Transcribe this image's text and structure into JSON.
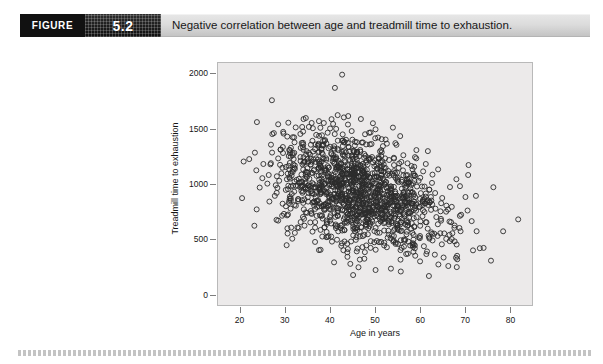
{
  "figure": {
    "label": "FIGURE",
    "number": "5.2",
    "caption": "Negative correlation between age and treadmill time to exhaustion."
  },
  "colors": {
    "header_band": "#dcdcdc",
    "label_box": "#111111",
    "panel_background": "#eceaea",
    "panel_border": "#b9b9b9",
    "point_stroke": "#2b2b2b",
    "rule": "#b9b9b9"
  },
  "chart_data": {
    "type": "scatter",
    "title": "Negative correlation between age and treadmill time to exhaustion.",
    "xlabel": "Age in years",
    "ylabel": "Treadmill time to exhaustion",
    "xlim": [
      15,
      85
    ],
    "ylim": [
      -100,
      2100
    ],
    "xticks": [
      20,
      30,
      40,
      50,
      60,
      70,
      80
    ],
    "xtick_labels": [
      "20",
      "30",
      "40",
      "50",
      "60",
      "70",
      "80"
    ],
    "yticks": [
      0,
      500,
      1000,
      1500,
      2000
    ],
    "ytick_labels": [
      "0",
      "500",
      "1000",
      "1500",
      "2000"
    ],
    "grid": false,
    "legend": false,
    "marker": "open-circle",
    "marker_size_px": 5,
    "n_points": 1400,
    "relationship": "negative",
    "correlation_estimate": -0.45,
    "x_mean": 46,
    "x_sd": 9.5,
    "y_intercept": 1450,
    "y_slope": -11.5,
    "y_residual_sd": 250,
    "x_range_observed": [
      18,
      82
    ],
    "y_range_observed": [
      120,
      2000
    ],
    "density_note": "Dense cluster between ages 38-58 and times 500-1100; sparse tails at young and old ages."
  },
  "axes": {
    "y_label_text": "Treadmill time to exhaustion",
    "x_label_text": "Age in years"
  }
}
